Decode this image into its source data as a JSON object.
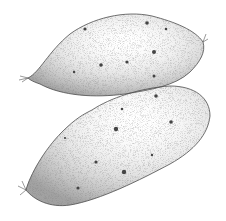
{
  "image": {
    "subject": "two sweet potatoes stipple illustration",
    "background": "#ffffff",
    "ink": "#3a3a3a",
    "items": [
      {
        "name": "upper-sweet-potato"
      },
      {
        "name": "lower-sweet-potato"
      }
    ]
  }
}
